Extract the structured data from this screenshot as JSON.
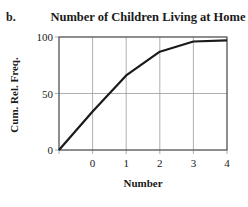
{
  "part_label": "b.",
  "chart_data": {
    "type": "line",
    "title": "Number of Children Living at Home",
    "xlabel": "Number",
    "ylabel": "Cum. Rel. Freq.",
    "x": [
      -1,
      0,
      1,
      2,
      3,
      4
    ],
    "series": [
      {
        "name": "Cumulative Relative Frequency",
        "values": [
          0,
          34,
          66,
          87,
          96,
          97
        ]
      }
    ],
    "x_ticks": [
      0,
      1,
      2,
      3,
      4
    ],
    "x_tick_labels": [
      "0",
      "1",
      "2",
      "3",
      "4"
    ],
    "y_ticks": [
      0,
      50,
      100
    ],
    "y_tick_labels": [
      "0",
      "50",
      "100"
    ],
    "xlim": [
      -1,
      4
    ],
    "ylim": [
      0,
      100
    ],
    "grid": true,
    "legend": null,
    "line_color": "#1a1a1a",
    "grid_color": "#9a9a9a"
  }
}
